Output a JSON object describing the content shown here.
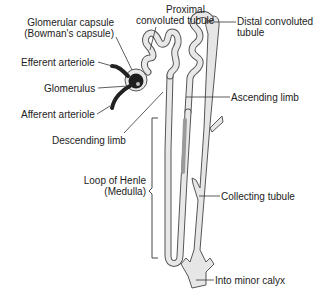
{
  "diagram": {
    "colors": {
      "tubule_fill": "#e8e8e8",
      "tubule_stroke": "#555555",
      "glomerulus": "#222222",
      "leader": "#333333",
      "text": "#222222"
    },
    "labels": {
      "glomerular_capsule_line1": "Glomerular capsule",
      "glomerular_capsule_line2": "(Bowman's capsule)",
      "proximal_line1": "Proximal",
      "proximal_line2": "convoluted tubule",
      "distal_line1": "Distal convoluted",
      "distal_line2": "tubule",
      "efferent": "Efferent arteriole",
      "glomerulus": "Glomerulus",
      "afferent": "Afferent arteriole",
      "ascending": "Ascending limb",
      "descending": "Descending limb",
      "loop_line1": "Loop of Henle",
      "loop_line2": "(Medulla)",
      "collecting": "Collecting tubule",
      "calyx": "Into minor calyx"
    }
  }
}
